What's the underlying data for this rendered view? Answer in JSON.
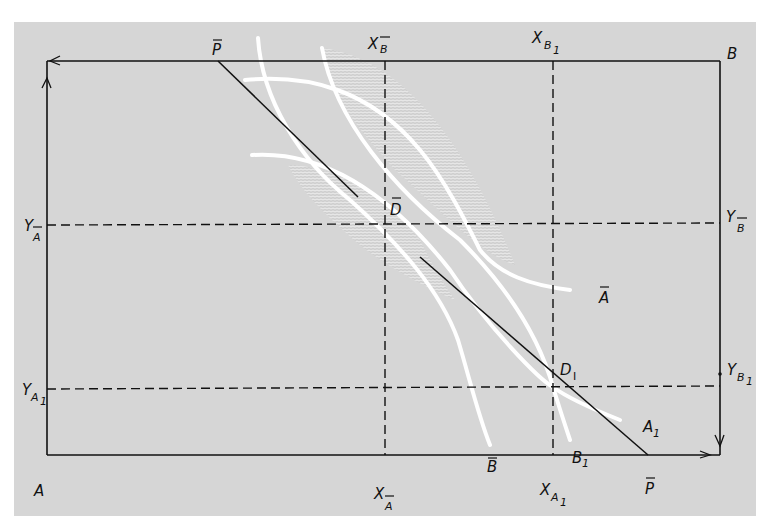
{
  "diagram": {
    "type": "edgeworth_box",
    "colors": {
      "background": "#d6d6d6",
      "page": "#ffffff",
      "lines": "#111111",
      "curves": "#ffffff",
      "lens_hatch": "#e6e6e6"
    },
    "corners": {
      "origin_A": "A",
      "origin_B": "B"
    },
    "price_line": {
      "label_top": "P",
      "label_bottom": "P"
    },
    "points": {
      "d_bar": "D",
      "d_one_main": "D",
      "d_one_sub": "I"
    },
    "axis_labels": {
      "x_b_bar_main": "X",
      "x_b_bar_sub": "B",
      "x_b1_main": "X",
      "x_b1_sub": "B",
      "x_b1_sub2": "1",
      "x_a_bar_main": "X",
      "x_a_bar_sub": "A",
      "x_a1_main": "X",
      "x_a1_sub": "A",
      "x_a1_sub2": "1",
      "y_a_bar_main": "Y",
      "y_a_bar_sub": "A",
      "y_a1_main": "Y",
      "y_a1_sub": "A",
      "y_a1_sub2": "1",
      "y_b_bar_main": "Y",
      "y_b_bar_sub": "B",
      "y_b1_main": "Y",
      "y_b1_sub": "B",
      "y_b1_sub2": "1"
    },
    "curve_labels": {
      "a_bar": "A",
      "a1_main": "A",
      "a1_sub": "1",
      "b_bar": "B",
      "b1_main": "B",
      "b1_sub": "1"
    }
  }
}
